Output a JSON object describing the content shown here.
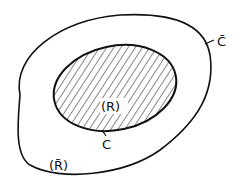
{
  "diagram": {
    "outer_region": {
      "label": "(R̄)",
      "boundary_label": "C̄"
    },
    "inner_region": {
      "label": "(R)",
      "boundary_label": "C",
      "hatched": true
    },
    "colors": {
      "stroke": "#111111",
      "background": "#ffffff"
    }
  }
}
